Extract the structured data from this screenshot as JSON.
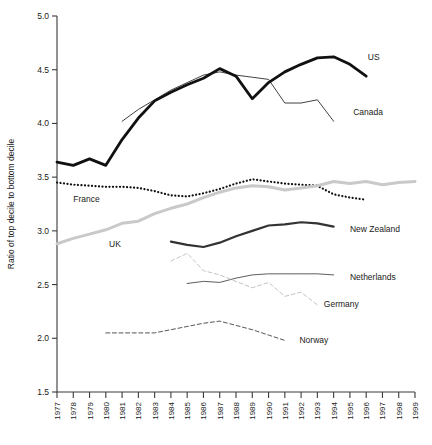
{
  "chart_data": {
    "type": "line",
    "title": "",
    "xlabel": "",
    "ylabel": "Ratio of top decile to bottom decile",
    "xlim": [
      1977,
      1999
    ],
    "ylim": [
      1.5,
      5.0
    ],
    "ytick_step": 0.5,
    "yticks": [
      "5.0",
      "4.5",
      "4.0",
      "3.5",
      "3.0",
      "2.5",
      "2.0",
      "1.5"
    ],
    "ytick_values": [
      5.0,
      4.5,
      4.0,
      3.5,
      3.0,
      2.5,
      2.0,
      1.5
    ],
    "x": [
      1977,
      1978,
      1979,
      1980,
      1981,
      1982,
      1983,
      1984,
      1985,
      1986,
      1987,
      1988,
      1989,
      1990,
      1991,
      1992,
      1993,
      1994,
      1995,
      1996,
      1997,
      1998,
      1999
    ],
    "xticks": [
      "1977",
      "1978",
      "1979",
      "1980",
      "1981",
      "1982",
      "1983",
      "1984",
      "1985",
      "1986",
      "1987",
      "1988",
      "1989",
      "1990",
      "1991",
      "1992",
      "1993",
      "1994",
      "1995",
      "1996",
      "1997",
      "1998",
      "1999"
    ],
    "grid": false,
    "legend_position": "inline-right",
    "series": [
      {
        "name": "US",
        "label": "US",
        "color": "#111111",
        "width": 2.8,
        "dash": "none",
        "label_x": 1996.1,
        "label_y": 4.62,
        "x": [
          1977,
          1978,
          1979,
          1980,
          1981,
          1982,
          1983,
          1984,
          1985,
          1986,
          1987,
          1988,
          1989,
          1990,
          1991,
          1992,
          1993,
          1994,
          1995,
          1996
        ],
        "values": [
          3.64,
          3.61,
          3.67,
          3.61,
          3.85,
          4.05,
          4.21,
          4.29,
          4.36,
          4.42,
          4.51,
          4.44,
          4.23,
          4.38,
          4.48,
          4.55,
          4.61,
          4.62,
          4.55,
          4.44
        ]
      },
      {
        "name": "Canada",
        "label": "Canada",
        "color": "#111111",
        "width": 0.8,
        "dash": "none",
        "label_x": 1995.2,
        "label_y": 4.11,
        "x": [
          1981,
          1982,
          1983,
          1984,
          1985,
          1986,
          1987,
          1988,
          1989,
          1990,
          1991,
          1992,
          1993,
          1994
        ],
        "values": [
          4.02,
          4.13,
          4.22,
          4.31,
          4.38,
          4.45,
          4.48,
          4.45,
          4.43,
          4.41,
          4.19,
          4.19,
          4.22,
          4.02
        ]
      },
      {
        "name": "France",
        "label": "France",
        "color": "#111111",
        "width": 2.2,
        "dash": "dotted",
        "label_x": 1978.0,
        "label_y": 3.3,
        "x": [
          1977,
          1978,
          1979,
          1980,
          1981,
          1982,
          1983,
          1984,
          1985,
          1986,
          1987,
          1988,
          1989,
          1990,
          1991,
          1992,
          1993,
          1994,
          1995,
          1996
        ],
        "values": [
          3.45,
          3.43,
          3.42,
          3.41,
          3.41,
          3.4,
          3.37,
          3.33,
          3.32,
          3.35,
          3.39,
          3.44,
          3.48,
          3.46,
          3.44,
          3.43,
          3.42,
          3.34,
          3.31,
          3.29
        ]
      },
      {
        "name": "UK",
        "label": "UK",
        "color": "#c9c9c9",
        "width": 3.0,
        "dash": "none",
        "label_x": 1980.2,
        "label_y": 2.88,
        "x": [
          1977,
          1978,
          1979,
          1980,
          1981,
          1982,
          1983,
          1984,
          1985,
          1986,
          1987,
          1988,
          1989,
          1990,
          1991,
          1992,
          1993,
          1994,
          1995,
          1996,
          1997,
          1998,
          1999
        ],
        "values": [
          2.88,
          2.93,
          2.97,
          3.01,
          3.07,
          3.09,
          3.16,
          3.21,
          3.25,
          3.31,
          3.36,
          3.4,
          3.42,
          3.41,
          3.38,
          3.4,
          3.42,
          3.46,
          3.44,
          3.46,
          3.43,
          3.45,
          3.46
        ]
      },
      {
        "name": "New Zealand",
        "label": "New Zealand",
        "color": "#333333",
        "width": 2.2,
        "dash": "none",
        "label_x": 1995.0,
        "label_y": 3.02,
        "x": [
          1984,
          1985,
          1986,
          1987,
          1988,
          1989,
          1990,
          1991,
          1992,
          1993,
          1994
        ],
        "values": [
          2.9,
          2.87,
          2.85,
          2.89,
          2.95,
          3.0,
          3.05,
          3.06,
          3.08,
          3.07,
          3.04
        ]
      },
      {
        "name": "Netherlands",
        "label": "Netherlands",
        "color": "#333333",
        "width": 0.8,
        "dash": "none",
        "label_x": 1995.0,
        "label_y": 2.57,
        "x": [
          1985,
          1986,
          1987,
          1988,
          1989,
          1990,
          1991,
          1992,
          1993,
          1994
        ],
        "values": [
          2.51,
          2.53,
          2.52,
          2.56,
          2.59,
          2.6,
          2.6,
          2.6,
          2.6,
          2.59
        ]
      },
      {
        "name": "Germany",
        "label": "Germany",
        "color": "#bdbdbd",
        "width": 0.9,
        "dash": "dashed",
        "label_x": 1993.4,
        "label_y": 2.32,
        "x": [
          1984,
          1985,
          1986,
          1987,
          1988,
          1989,
          1990,
          1991,
          1992,
          1993
        ],
        "values": [
          2.72,
          2.79,
          2.63,
          2.59,
          2.53,
          2.47,
          2.52,
          2.39,
          2.43,
          2.31
        ]
      },
      {
        "name": "Norway",
        "label": "Norway",
        "color": "#2b2b2b",
        "width": 0.8,
        "dash": "dashed",
        "label_x": 1991.9,
        "label_y": 1.98,
        "x": [
          1980,
          1981,
          1982,
          1983,
          1984,
          1985,
          1986,
          1987,
          1988,
          1989,
          1990,
          1991
        ],
        "values": [
          2.05,
          2.05,
          2.05,
          2.05,
          2.08,
          2.11,
          2.14,
          2.16,
          2.12,
          2.08,
          2.03,
          1.98
        ]
      }
    ]
  }
}
